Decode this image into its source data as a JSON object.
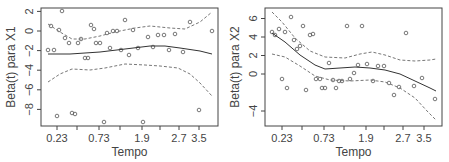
{
  "chart_data": [
    {
      "type": "scatter",
      "title": "",
      "xlabel": "Tempo",
      "ylabel": "Beta(t) para X1",
      "x_tick_labels": [
        "0.23",
        "0.73",
        "1.9",
        "2.7",
        "3.5"
      ],
      "x_tick_positions_px": [
        57,
        99,
        142,
        179,
        199
      ],
      "x_minor_tick_positions_px": [
        77,
        120,
        160
      ],
      "y_ticks": [
        2,
        0,
        -2,
        -4,
        -6,
        -8
      ],
      "ylim": [
        -9.7,
        2.5
      ],
      "grid": false,
      "legend": null,
      "series": [
        {
          "name": "residuals",
          "style": "open-circle",
          "points_px": [
            [
              48,
              50
            ],
            [
              51,
              26
            ],
            [
              54,
              50
            ],
            [
              57,
              116
            ],
            [
              59,
              30
            ],
            [
              62,
              11
            ],
            [
              65,
              38
            ],
            [
              69,
              43
            ],
            [
              72,
              113
            ],
            [
              75,
              114
            ],
            [
              78,
              43
            ],
            [
              81,
              39
            ],
            [
              85,
              58
            ],
            [
              88,
              58
            ],
            [
              91,
              25
            ],
            [
              94,
              29
            ],
            [
              96,
              43
            ],
            [
              100,
              43
            ],
            [
              104,
              122
            ],
            [
              107,
              33
            ],
            [
              110,
              48
            ],
            [
              113,
              31
            ],
            [
              117,
              31
            ],
            [
              121,
              50
            ],
            [
              125,
              20
            ],
            [
              129,
              55
            ],
            [
              133,
              30
            ],
            [
              138,
              48
            ],
            [
              143,
              122
            ],
            [
              148,
              37
            ],
            [
              153,
              47
            ],
            [
              158,
              35
            ],
            [
              164,
              35
            ],
            [
              169,
              50
            ],
            [
              175,
              34
            ],
            [
              183,
              52
            ],
            [
              190,
              22
            ],
            [
              199,
              110
            ],
            [
              212,
              31
            ]
          ]
        },
        {
          "name": "smooth estimate",
          "style": "solid-line",
          "points_px": [
            [
              48,
              54
            ],
            [
              70,
              54
            ],
            [
              100,
              52
            ],
            [
              125,
              49
            ],
            [
              150,
              46
            ],
            [
              165,
              46
            ],
            [
              180,
              48
            ],
            [
              200,
              51
            ],
            [
              212,
              54
            ]
          ]
        },
        {
          "name": "upper band",
          "style": "dashed-line",
          "points_px": [
            [
              48,
              24
            ],
            [
              60,
              32
            ],
            [
              72,
              39
            ],
            [
              85,
              39
            ],
            [
              100,
              36
            ],
            [
              115,
              32
            ],
            [
              135,
              28
            ],
            [
              150,
              26
            ],
            [
              170,
              28
            ],
            [
              185,
              29
            ],
            [
              200,
              22
            ],
            [
              212,
              12
            ]
          ]
        },
        {
          "name": "lower band",
          "style": "dashed-line",
          "points_px": [
            [
              48,
              82
            ],
            [
              60,
              74
            ],
            [
              72,
              69
            ],
            [
              90,
              70
            ],
            [
              105,
              68
            ],
            [
              125,
              64
            ],
            [
              145,
              65
            ],
            [
              160,
              66
            ],
            [
              178,
              68
            ],
            [
              190,
              74
            ],
            [
              200,
              83
            ],
            [
              212,
              96
            ]
          ]
        }
      ]
    },
    {
      "type": "scatter",
      "title": "",
      "xlabel": "Tempo",
      "ylabel": "Beta(t) para X2",
      "x_tick_labels": [
        "0.23",
        "0.73",
        "1.9",
        "2.7",
        "3.5"
      ],
      "x_tick_positions_px": [
        282,
        324,
        366,
        403,
        424
      ],
      "x_minor_tick_positions_px": [
        302,
        344,
        384
      ],
      "y_ticks": [
        6,
        4,
        2,
        0,
        -4
      ],
      "ylim": [
        -5.5,
        7
      ],
      "grid": false,
      "legend": null,
      "series": [
        {
          "name": "residuals",
          "style": "open-circle",
          "points_px": [
            [
              272,
              32
            ],
            [
              275,
              35
            ],
            [
              279,
              29
            ],
            [
              282,
              79
            ],
            [
              285,
              32
            ],
            [
              287,
              88
            ],
            [
              291,
              17
            ],
            [
              294,
              40
            ],
            [
              297,
              49
            ],
            [
              300,
              46
            ],
            [
              303,
              26
            ],
            [
              306,
              90
            ],
            [
              310,
              35
            ],
            [
              313,
              34
            ],
            [
              316,
              79
            ],
            [
              320,
              79
            ],
            [
              322,
              88
            ],
            [
              325,
              88
            ],
            [
              329,
              63
            ],
            [
              333,
              80
            ],
            [
              336,
              88
            ],
            [
              339,
              81
            ],
            [
              342,
              81
            ],
            [
              347,
              26
            ],
            [
              350,
              79
            ],
            [
              354,
              73
            ],
            [
              358,
              65
            ],
            [
              362,
              26
            ],
            [
              367,
              64
            ],
            [
              373,
              81
            ],
            [
              378,
              66
            ],
            [
              384,
              66
            ],
            [
              389,
              83
            ],
            [
              394,
              95
            ],
            [
              399,
              87
            ],
            [
              406,
              33
            ],
            [
              414,
              86
            ],
            [
              422,
              78
            ],
            [
              435,
              99
            ]
          ]
        },
        {
          "name": "smooth estimate",
          "style": "solid-line",
          "points_px": [
            [
              272,
              33
            ],
            [
              285,
              42
            ],
            [
              300,
              55
            ],
            [
              315,
              65
            ],
            [
              325,
              69
            ],
            [
              340,
              68
            ],
            [
              355,
              67
            ],
            [
              370,
              68
            ],
            [
              385,
              70
            ],
            [
              400,
              74
            ],
            [
              415,
              81
            ],
            [
              430,
              88
            ],
            [
              436,
              91
            ]
          ]
        },
        {
          "name": "upper band",
          "style": "dashed-line",
          "points_px": [
            [
              272,
              12
            ],
            [
              282,
              22
            ],
            [
              295,
              38
            ],
            [
              310,
              51
            ],
            [
              325,
              57
            ],
            [
              345,
              58
            ],
            [
              360,
              54
            ],
            [
              372,
              52
            ],
            [
              385,
              55
            ],
            [
              400,
              60
            ],
            [
              415,
              61
            ],
            [
              430,
              60
            ],
            [
              436,
              59
            ]
          ]
        },
        {
          "name": "lower band",
          "style": "dashed-line",
          "points_px": [
            [
              272,
              54
            ],
            [
              285,
              57
            ],
            [
              300,
              66
            ],
            [
              315,
              76
            ],
            [
              330,
              80
            ],
            [
              350,
              81
            ],
            [
              370,
              80
            ],
            [
              385,
              82
            ],
            [
              400,
              88
            ],
            [
              415,
              98
            ],
            [
              428,
              112
            ],
            [
              436,
              120
            ]
          ]
        }
      ]
    }
  ],
  "panels": [
    {
      "ylabel": "Beta(t) para X1",
      "xlabel": "Tempo"
    },
    {
      "ylabel": "Beta(t) para X2",
      "xlabel": "Tempo"
    }
  ]
}
